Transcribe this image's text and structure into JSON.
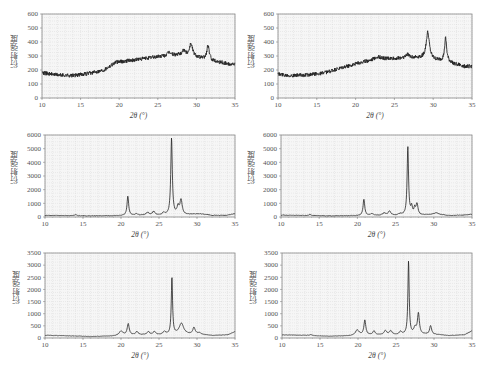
{
  "chart_data": [
    {
      "id": "p1",
      "type": "line",
      "title": "",
      "xlabel": "2θ (°)",
      "ylabel": "衍射强度",
      "xlim": [
        10,
        35
      ],
      "ylim": [
        0,
        600
      ],
      "xticks": [
        10,
        15,
        20,
        25,
        30,
        35
      ],
      "yticks": [
        0,
        100,
        200,
        300,
        400,
        500,
        600
      ],
      "grid": "dotted",
      "noise": 14,
      "baseline": [
        [
          10,
          180
        ],
        [
          12,
          165
        ],
        [
          14,
          160
        ],
        [
          16,
          175
        ],
        [
          18,
          200
        ],
        [
          19.5,
          255
        ],
        [
          21,
          265
        ],
        [
          23,
          280
        ],
        [
          25,
          295
        ],
        [
          27,
          305
        ],
        [
          28.5,
          305
        ],
        [
          29.3,
          310
        ],
        [
          30.5,
          285
        ],
        [
          31.5,
          275
        ],
        [
          32.5,
          262
        ],
        [
          34,
          245
        ],
        [
          35,
          240
        ]
      ],
      "peaks": [
        [
          26.5,
          25,
          0.25
        ],
        [
          28.3,
          35,
          0.25
        ],
        [
          29.3,
          80,
          0.22
        ],
        [
          31.5,
          100,
          0.18
        ]
      ]
    },
    {
      "id": "p2",
      "type": "line",
      "title": "",
      "xlabel": "2θ (°)",
      "ylabel": "衍射强度",
      "xlim": [
        10,
        35
      ],
      "ylim": [
        0,
        600
      ],
      "xticks": [
        10,
        15,
        20,
        25,
        30,
        35
      ],
      "yticks": [
        0,
        100,
        200,
        300,
        400,
        500,
        600
      ],
      "grid": "dotted",
      "noise": 14,
      "baseline": [
        [
          10,
          170
        ],
        [
          12,
          160
        ],
        [
          14,
          165
        ],
        [
          16,
          180
        ],
        [
          18,
          210
        ],
        [
          20,
          245
        ],
        [
          22,
          270
        ],
        [
          23,
          280
        ],
        [
          25,
          280
        ],
        [
          27,
          290
        ],
        [
          28.5,
          285
        ],
        [
          30,
          270
        ],
        [
          31,
          265
        ],
        [
          32,
          255
        ],
        [
          33,
          240
        ],
        [
          34,
          225
        ],
        [
          35,
          225
        ]
      ],
      "peaks": [
        [
          22.8,
          15,
          0.5
        ],
        [
          26.7,
          20,
          0.3
        ],
        [
          29.3,
          190,
          0.25
        ],
        [
          31.6,
          165,
          0.16
        ]
      ]
    },
    {
      "id": "p3",
      "type": "line",
      "title": "",
      "xlabel": "2θ (°)",
      "ylabel": "衍射强度",
      "xlim": [
        10,
        35
      ],
      "ylim": [
        0,
        6000
      ],
      "xticks": [
        10,
        15,
        20,
        25,
        30,
        35
      ],
      "yticks": [
        0,
        1000,
        2000,
        3000,
        4000,
        5000,
        6000
      ],
      "grid": "dotted",
      "noise": 20,
      "baseline": [
        [
          10,
          120
        ],
        [
          13,
          100
        ],
        [
          16,
          80
        ],
        [
          19,
          90
        ],
        [
          22,
          120
        ],
        [
          25,
          130
        ],
        [
          28,
          140
        ],
        [
          29.5,
          200
        ],
        [
          30.5,
          220
        ],
        [
          32,
          120
        ],
        [
          34,
          130
        ],
        [
          35,
          240
        ]
      ],
      "peaks": [
        [
          14,
          80,
          0.2
        ],
        [
          20.9,
          1400,
          0.13
        ],
        [
          22,
          120,
          0.2
        ],
        [
          23.5,
          200,
          0.25
        ],
        [
          24.3,
          250,
          0.2
        ],
        [
          25.6,
          150,
          0.2
        ],
        [
          26.65,
          5600,
          0.12
        ],
        [
          27.5,
          550,
          0.15
        ],
        [
          27.9,
          1100,
          0.18
        ]
      ]
    },
    {
      "id": "p4",
      "type": "line",
      "title": "",
      "xlabel": "2θ (°)",
      "ylabel": "衍射强度",
      "xlim": [
        10,
        35
      ],
      "ylim": [
        0,
        6000
      ],
      "xticks": [
        10,
        15,
        20,
        25,
        30,
        35
      ],
      "yticks": [
        0,
        1000,
        2000,
        3000,
        4000,
        5000,
        6000
      ],
      "grid": "dotted",
      "noise": 20,
      "baseline": [
        [
          10,
          140
        ],
        [
          13,
          110
        ],
        [
          16,
          80
        ],
        [
          19,
          90
        ],
        [
          22,
          110
        ],
        [
          25,
          120
        ],
        [
          28,
          140
        ],
        [
          29.5,
          180
        ],
        [
          30.5,
          200
        ],
        [
          32,
          110
        ],
        [
          34,
          140
        ],
        [
          35,
          200
        ]
      ],
      "peaks": [
        [
          13.8,
          80,
          0.2
        ],
        [
          20.85,
          1200,
          0.13
        ],
        [
          21.9,
          130,
          0.2
        ],
        [
          23.5,
          160,
          0.25
        ],
        [
          24.2,
          300,
          0.2
        ],
        [
          25.6,
          100,
          0.2
        ],
        [
          26.6,
          5000,
          0.11
        ],
        [
          27.1,
          550,
          0.12
        ],
        [
          27.5,
          450,
          0.12
        ],
        [
          27.8,
          800,
          0.15
        ],
        [
          30.3,
          100,
          0.3
        ]
      ]
    },
    {
      "id": "p5",
      "type": "line",
      "title": "",
      "xlabel": "2θ (°)",
      "ylabel": "衍射强度",
      "xlim": [
        10,
        35
      ],
      "ylim": [
        0,
        3500
      ],
      "xticks": [
        10,
        15,
        20,
        25,
        30,
        35
      ],
      "yticks": [
        0,
        500,
        1000,
        1500,
        2000,
        2500,
        3000,
        3500
      ],
      "grid": "dotted",
      "noise": 8,
      "baseline": [
        [
          10,
          110
        ],
        [
          13,
          90
        ],
        [
          16,
          60
        ],
        [
          19,
          80
        ],
        [
          21,
          120
        ],
        [
          23,
          130
        ],
        [
          25,
          130
        ],
        [
          28,
          150
        ],
        [
          30,
          150
        ],
        [
          32,
          100
        ],
        [
          34,
          130
        ],
        [
          35,
          260
        ]
      ],
      "peaks": [
        [
          20,
          180,
          0.3
        ],
        [
          20.95,
          450,
          0.16
        ],
        [
          22.1,
          130,
          0.2
        ],
        [
          23.6,
          120,
          0.2
        ],
        [
          24.4,
          130,
          0.2
        ],
        [
          25.7,
          120,
          0.2
        ],
        [
          26.7,
          2350,
          0.1
        ],
        [
          27.95,
          450,
          0.35
        ],
        [
          29.6,
          270,
          0.18
        ],
        [
          30.3,
          60,
          0.3
        ]
      ]
    },
    {
      "id": "p6",
      "type": "line",
      "title": "",
      "xlabel": "2θ (°)",
      "ylabel": "衍射强度",
      "xlim": [
        10,
        35
      ],
      "ylim": [
        0,
        3500
      ],
      "xticks": [
        10,
        15,
        20,
        25,
        30,
        35
      ],
      "yticks": [
        0,
        500,
        1000,
        1500,
        2000,
        2500,
        3000,
        3500
      ],
      "grid": "dotted",
      "noise": 8,
      "baseline": [
        [
          10,
          130
        ],
        [
          13,
          110
        ],
        [
          16,
          70
        ],
        [
          19,
          90
        ],
        [
          21,
          120
        ],
        [
          23,
          130
        ],
        [
          25,
          130
        ],
        [
          28,
          150
        ],
        [
          30,
          150
        ],
        [
          32,
          100
        ],
        [
          34,
          130
        ],
        [
          35,
          300
        ]
      ],
      "peaks": [
        [
          13.8,
          40,
          0.2
        ],
        [
          19.9,
          220,
          0.3
        ],
        [
          20.9,
          600,
          0.15
        ],
        [
          22.1,
          160,
          0.18
        ],
        [
          23.6,
          170,
          0.2
        ],
        [
          24.3,
          160,
          0.2
        ],
        [
          25.6,
          120,
          0.2
        ],
        [
          26.65,
          3000,
          0.1
        ],
        [
          27.5,
          250,
          0.2
        ],
        [
          27.95,
          850,
          0.15
        ],
        [
          29.55,
          350,
          0.15
        ]
      ]
    }
  ],
  "panels": [
    {
      "ylabel": "衍射强度",
      "xlabel": "2θ (°)"
    },
    {
      "ylabel": "衍射强度",
      "xlabel": "2θ (°)"
    },
    {
      "ylabel": "衍射强度",
      "xlabel": "2θ (°)"
    },
    {
      "ylabel": "衍射强度",
      "xlabel": "2θ (°)"
    },
    {
      "ylabel": "衍射强度",
      "xlabel": "2θ (°)"
    },
    {
      "ylabel": "衍射强度",
      "xlabel": "2θ (°)"
    }
  ],
  "style": {
    "line_color": "#222222",
    "frame_color": "#888888",
    "grid_color": "#cccccc",
    "plot_bg": "#f6f6f6"
  }
}
